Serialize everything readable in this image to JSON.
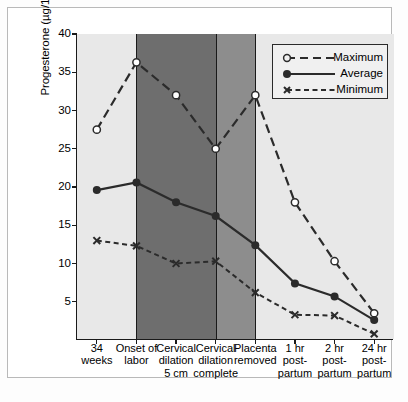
{
  "chart_data": {
    "type": "line",
    "title": "",
    "xlabel": "",
    "ylabel": "Progesterone (µg/100 mL plasma)",
    "ylim": [
      0,
      40
    ],
    "yticks": [
      5,
      10,
      15,
      20,
      25,
      30,
      35,
      40
    ],
    "grid": false,
    "legend_position": "top-right",
    "categories": [
      "34 weeks",
      "Onset of labor",
      "Cervical dilation 5 cm",
      "Cervical dilation complete",
      "Placenta removed",
      "1 hr post-partum",
      "2 hr post-partum",
      "24 hr post-partum"
    ],
    "series": [
      {
        "name": "Maximum",
        "marker": "open-circle",
        "line": "dashed",
        "values": [
          27.5,
          36.3,
          32.0,
          25.0,
          32.0,
          18.0,
          10.3,
          3.5
        ]
      },
      {
        "name": "Average",
        "marker": "filled-circle",
        "line": "solid",
        "values": [
          19.6,
          20.6,
          18.0,
          16.2,
          12.4,
          7.4,
          5.7,
          2.6
        ]
      },
      {
        "name": "Minimum",
        "marker": "x",
        "line": "dashed-fine",
        "values": [
          13.0,
          12.3,
          10.0,
          10.3,
          6.2,
          3.3,
          3.2,
          0.8
        ]
      }
    ],
    "bands": [
      {
        "from": 0,
        "to": 1,
        "color": "#e8e8e8"
      },
      {
        "from": 1,
        "to": 3,
        "color": "#6e6e6e"
      },
      {
        "from": 3,
        "to": 4,
        "color": "#8d8d8d"
      },
      {
        "from": 4,
        "to": 7,
        "color": "#e8e8e8"
      }
    ]
  },
  "axis": {
    "y_title": "Progesterone (µg/100 mL plasma)",
    "y_tick_labels": [
      "40",
      "35",
      "30",
      "25",
      "20",
      "15",
      "10",
      "5"
    ],
    "x_tick_labels": [
      "34\nweeks",
      "Onset of\nlabor",
      "Cervical\ndilation\n5 cm",
      "Cervical\ndilation\ncomplete",
      "Placenta\nremoved",
      "1 hr\npost-\npartum",
      "2 hr\npost-\npartum",
      "24 hr\npost-\npartum"
    ]
  },
  "legend": {
    "entries": [
      {
        "label": "Maximum",
        "marker": "open-circle-icon"
      },
      {
        "label": "Average",
        "marker": "filled-circle-icon"
      },
      {
        "label": "Minimum",
        "marker": "x-marker-icon"
      }
    ]
  },
  "colors": {
    "line": "#2b2b2b",
    "band_light": "#e8e8e8",
    "band_dark": "#6e6e6e",
    "band_mid": "#8d8d8d",
    "axis": "#1a1a1a",
    "frame": "#b9b9b9"
  }
}
